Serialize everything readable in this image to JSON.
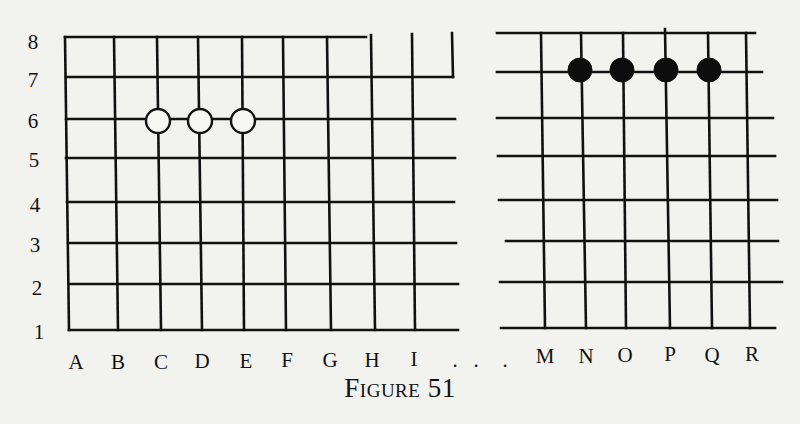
{
  "figure": {
    "caption": "Figure 51",
    "line_color": "#111111",
    "background_color": "#f2f2ef",
    "white_stone_fill": "#f7f7f4",
    "black_stone_fill": "#0d0d0d",
    "stone_radius": 12
  },
  "row_labels": [
    {
      "label": "8",
      "x": 33,
      "y": 42
    },
    {
      "label": "7",
      "x": 33,
      "y": 80
    },
    {
      "label": "6",
      "x": 33,
      "y": 121
    },
    {
      "label": "5",
      "x": 34,
      "y": 160
    },
    {
      "label": "4",
      "x": 35,
      "y": 205
    },
    {
      "label": "3",
      "x": 35,
      "y": 245
    },
    {
      "label": "2",
      "x": 37,
      "y": 288
    },
    {
      "label": "1",
      "x": 39,
      "y": 332
    }
  ],
  "column_labels": [
    {
      "label": "A",
      "x": 76,
      "y": 362
    },
    {
      "label": "B",
      "x": 118,
      "y": 362
    },
    {
      "label": "C",
      "x": 161,
      "y": 362
    },
    {
      "label": "D",
      "x": 202,
      "y": 361
    },
    {
      "label": "E",
      "x": 246,
      "y": 361
    },
    {
      "label": "F",
      "x": 287,
      "y": 360
    },
    {
      "label": "G",
      "x": 330,
      "y": 360
    },
    {
      "label": "H",
      "x": 372,
      "y": 360
    },
    {
      "label": "I",
      "x": 414,
      "y": 359
    },
    {
      "label": "M",
      "x": 545,
      "y": 356
    },
    {
      "label": "N",
      "x": 586,
      "y": 356
    },
    {
      "label": "O",
      "x": 625,
      "y": 355
    },
    {
      "label": "P",
      "x": 670,
      "y": 354
    },
    {
      "label": "Q",
      "x": 712,
      "y": 355
    },
    {
      "label": "R",
      "x": 752,
      "y": 354
    }
  ],
  "ellipsis": [
    {
      "label": ".",
      "x": 455,
      "y": 360
    },
    {
      "label": ".",
      "x": 476,
      "y": 360
    },
    {
      "label": ".",
      "x": 505,
      "y": 360
    }
  ],
  "left_grid": {
    "horizontal_lines": [
      {
        "row": 8,
        "x1": 65,
        "x2": 366,
        "y": 37
      },
      {
        "row": 7,
        "x1": 66,
        "x2": 453,
        "y": 77
      },
      {
        "row": 6,
        "x1": 66,
        "x2": 455,
        "y": 119
      },
      {
        "row": 5,
        "x1": 66,
        "x2": 455,
        "y": 158
      },
      {
        "row": 4,
        "x1": 67,
        "x2": 454,
        "y": 202
      },
      {
        "row": 3,
        "x1": 68,
        "x2": 456,
        "y": 243
      },
      {
        "row": 2,
        "x1": 69,
        "x2": 458,
        "y": 284
      },
      {
        "row": 1,
        "x1": 69,
        "x2": 458,
        "y": 330
      }
    ],
    "vertical_lines": [
      {
        "col": "A",
        "x1": 65,
        "y1": 37,
        "x2": 69,
        "y2": 330
      },
      {
        "col": "B",
        "x1": 114,
        "y1": 37,
        "x2": 118,
        "y2": 330
      },
      {
        "col": "C",
        "x1": 157,
        "y1": 37,
        "x2": 161,
        "y2": 330
      },
      {
        "col": "D",
        "x1": 198,
        "y1": 37,
        "x2": 202,
        "y2": 330
      },
      {
        "col": "E",
        "x1": 242,
        "y1": 37,
        "x2": 244,
        "y2": 330
      },
      {
        "col": "F",
        "x1": 283,
        "y1": 37,
        "x2": 286,
        "y2": 330
      },
      {
        "col": "G",
        "x1": 327,
        "y1": 37,
        "x2": 331,
        "y2": 330
      },
      {
        "col": "H",
        "x1": 371,
        "y1": 35,
        "x2": 375,
        "y2": 330
      },
      {
        "col": "I",
        "x1": 412,
        "y1": 34,
        "x2": 415,
        "y2": 330
      },
      {
        "col": "edge",
        "x1": 452,
        "y1": 33,
        "x2": 453,
        "y2": 77
      }
    ],
    "stones": [
      {
        "color": "white",
        "point": "C6",
        "x": 158,
        "y": 121
      },
      {
        "color": "white",
        "point": "D6",
        "x": 200,
        "y": 121
      },
      {
        "color": "white",
        "point": "E6",
        "x": 243,
        "y": 121
      }
    ]
  },
  "right_grid": {
    "horizontal_lines": [
      {
        "row": 8,
        "x1": 497,
        "x2": 755,
        "y": 33
      },
      {
        "row": 7,
        "x1": 497,
        "x2": 762,
        "y": 72
      },
      {
        "row": 6,
        "x1": 497,
        "x2": 773,
        "y": 118
      },
      {
        "row": 5,
        "x1": 498,
        "x2": 775,
        "y": 156
      },
      {
        "row": 4,
        "x1": 499,
        "x2": 777,
        "y": 200
      },
      {
        "row": 3,
        "x1": 506,
        "x2": 778,
        "y": 241
      },
      {
        "row": 2,
        "x1": 500,
        "x2": 782,
        "y": 282
      },
      {
        "row": 1,
        "x1": 501,
        "x2": 775,
        "y": 328
      }
    ],
    "vertical_lines": [
      {
        "col": "M",
        "x1": 541,
        "y1": 33,
        "x2": 545,
        "y2": 328
      },
      {
        "col": "N",
        "x1": 581,
        "y1": 33,
        "x2": 586,
        "y2": 328
      },
      {
        "col": "O",
        "x1": 623,
        "y1": 33,
        "x2": 626,
        "y2": 328
      },
      {
        "col": "P",
        "x1": 665,
        "y1": 29,
        "x2": 670,
        "y2": 328
      },
      {
        "col": "Q",
        "x1": 708,
        "y1": 33,
        "x2": 712,
        "y2": 328
      },
      {
        "col": "R",
        "x1": 746,
        "y1": 33,
        "x2": 750,
        "y2": 328
      }
    ],
    "stones": [
      {
        "color": "black",
        "point": "N7",
        "x": 580,
        "y": 70
      },
      {
        "color": "black",
        "point": "O7",
        "x": 622,
        "y": 70
      },
      {
        "color": "black",
        "point": "P7",
        "x": 666,
        "y": 70
      },
      {
        "color": "black",
        "point": "Q7",
        "x": 709,
        "y": 70
      }
    ]
  }
}
